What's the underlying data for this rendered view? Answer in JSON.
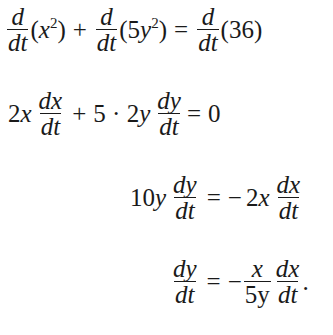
{
  "equations": [
    {
      "id": "line1",
      "latex": "\\frac{d}{dt}(x^2) + \\frac{d}{dt}(5y^2) = \\frac{d}{dt}(36)",
      "parts": {
        "f1_num": "d",
        "f1_den": "dt",
        "t1_open": "(",
        "t1_var": "x",
        "t1_exp": "2",
        "t1_close": ")",
        "plus": "+",
        "f2_num": "d",
        "f2_den": "dt",
        "t2_open": "(5",
        "t2_var": "y",
        "t2_exp": "2",
        "t2_close": ")",
        "eq": "=",
        "f3_num": "d",
        "f3_den": "dt",
        "t3": "(36)"
      }
    },
    {
      "id": "line2",
      "latex": "2x\\frac{dx}{dt} + 5 \\cdot 2y\\frac{dy}{dt} = 0",
      "parts": {
        "c1": "2",
        "v1": "x",
        "f1_num": "dx",
        "f1_den": "dt",
        "plus": "+",
        "c2": "5 · 2",
        "v2": "y",
        "f2_num": "dy",
        "f2_den": "dt",
        "eq": "=",
        "rhs": "0"
      }
    },
    {
      "id": "line3",
      "latex": "10y\\frac{dy}{dt} = -2x\\frac{dx}{dt}",
      "parts": {
        "c1": "10",
        "v1": "y",
        "f1_num": "dy",
        "f1_den": "dt",
        "eq": "=",
        "minus": "−",
        "c2": "2",
        "v2": "x",
        "f2_num": "dx",
        "f2_den": "dt"
      }
    },
    {
      "id": "line4",
      "latex": "\\frac{dy}{dt} = -\\frac{x}{5y}\\frac{dx}{dt}.",
      "parts": {
        "f1_num": "dy",
        "f1_den": "dt",
        "eq": "=",
        "minus": "−",
        "f2_num": "x",
        "f2_den": "5y",
        "f3_num": "dx",
        "f3_den": "dt",
        "period": "."
      }
    }
  ]
}
